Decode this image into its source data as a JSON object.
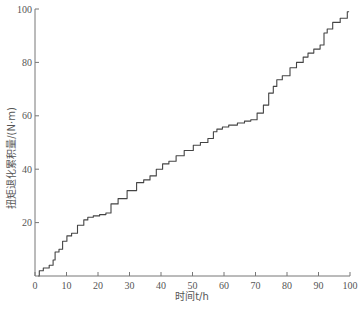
{
  "chart_data": {
    "type": "line",
    "title": "",
    "xlabel": "时间t/h",
    "ylabel": "扭矩退化累积量/(N·m)",
    "xlim": [
      0,
      100
    ],
    "ylim": [
      0,
      100
    ],
    "x_ticks": [
      0,
      10,
      20,
      30,
      40,
      50,
      60,
      70,
      80,
      90,
      100
    ],
    "y_ticks": [
      20,
      40,
      60,
      80,
      100
    ],
    "grid": false,
    "legend": null,
    "series": [
      {
        "name": "torque-degradation-cumulative",
        "color": "#444444",
        "step": true,
        "points": [
          [
            1,
            0
          ],
          [
            1.5,
            2
          ],
          [
            3,
            3
          ],
          [
            5,
            4
          ],
          [
            6,
            6
          ],
          [
            6.5,
            9
          ],
          [
            8,
            10
          ],
          [
            9,
            13
          ],
          [
            10.5,
            15
          ],
          [
            12,
            16
          ],
          [
            14,
            19
          ],
          [
            16,
            21
          ],
          [
            17,
            22
          ],
          [
            19,
            22.5
          ],
          [
            21,
            23
          ],
          [
            23,
            23.6
          ],
          [
            24.5,
            27
          ],
          [
            27,
            29
          ],
          [
            30,
            32
          ],
          [
            33,
            35
          ],
          [
            35,
            36
          ],
          [
            37,
            37.5
          ],
          [
            39,
            40
          ],
          [
            41,
            42
          ],
          [
            43,
            43
          ],
          [
            45.4,
            45
          ],
          [
            48,
            47
          ],
          [
            51,
            49
          ],
          [
            53,
            50
          ],
          [
            55.5,
            51.5
          ],
          [
            57,
            54
          ],
          [
            58,
            55
          ],
          [
            60,
            55.8
          ],
          [
            62,
            56.5
          ],
          [
            65,
            57.3
          ],
          [
            67,
            58
          ],
          [
            69,
            58.5
          ],
          [
            71,
            61
          ],
          [
            73,
            64
          ],
          [
            74.6,
            68.5
          ],
          [
            76,
            71
          ],
          [
            77,
            73.5
          ],
          [
            79,
            75
          ],
          [
            81.6,
            78
          ],
          [
            83.5,
            80
          ],
          [
            85.7,
            82
          ],
          [
            87,
            83.5
          ],
          [
            89,
            85
          ],
          [
            91,
            86.5
          ],
          [
            92,
            91
          ],
          [
            93,
            92.5
          ],
          [
            95,
            95
          ],
          [
            97.5,
            96.5
          ],
          [
            99.7,
            99
          ]
        ]
      }
    ]
  }
}
